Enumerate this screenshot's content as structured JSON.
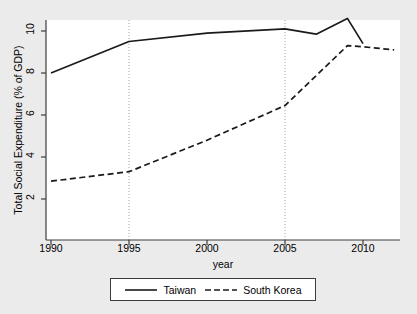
{
  "chart_data": {
    "type": "line",
    "title": "",
    "xlabel": "year",
    "ylabel": "Total Social Expenditure (% of GDP)",
    "xlim": [
      1990,
      2012.3
    ],
    "ylim": [
      2,
      11
    ],
    "xticks": [
      1990,
      1995,
      2000,
      2005,
      2010
    ],
    "xtick_labels": [
      "1990",
      "1995",
      "2000",
      "2005",
      "2010"
    ],
    "yticks": [
      2,
      4,
      6,
      8,
      10
    ],
    "ytick_labels": [
      "2",
      "4",
      "6",
      "8",
      "10"
    ],
    "grid": false,
    "reference_lines": [
      1995,
      2005
    ],
    "legend_position": "below-center",
    "series": [
      {
        "name": "Taiwan",
        "style": "solid",
        "color": "#1a1a1a",
        "x": [
          1990,
          1995,
          2000,
          2005,
          2007,
          2009,
          2010
        ],
        "values": [
          8.0,
          9.5,
          9.9,
          10.1,
          9.85,
          10.6,
          9.4
        ]
      },
      {
        "name": "South Korea",
        "style": "dashed",
        "color": "#1a1a1a",
        "x": [
          1990,
          1995,
          2000,
          2005,
          2009,
          2010,
          2012
        ],
        "values": [
          2.85,
          3.3,
          4.8,
          6.45,
          9.3,
          9.25,
          9.1
        ]
      }
    ]
  },
  "legend": {
    "items": [
      {
        "label": "Taiwan"
      },
      {
        "label": "South Korea"
      }
    ]
  },
  "colors": {
    "background": "#ebebeb",
    "panel": "#ffffff",
    "line": "#1a1a1a",
    "axis": "#3c3c3c",
    "reference_line": "#a0a0a0"
  }
}
